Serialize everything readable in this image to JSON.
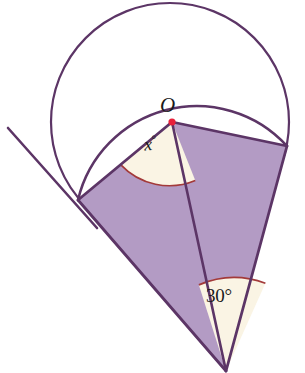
{
  "figure": {
    "canvas": {
      "width": 305,
      "height": 373
    },
    "colors": {
      "stroke": "#5c3566",
      "fill_purple": "#b39bc4",
      "fill_cream": "#faf4e4",
      "arc_marker": "#a33a3a",
      "center_dot": "#e8203a",
      "background": "#ffffff",
      "text": "#1a1a1a"
    },
    "labels": {
      "center_point": "O",
      "angle_at_center_value": "x",
      "angle_at_center_degree_symbol": "°",
      "angle_at_apex": "30°"
    },
    "points": {
      "O": {
        "x": 172,
        "y": 122,
        "name": "circle-center"
      },
      "A": {
        "x": 78,
        "y": 200,
        "name": "left-radius-endpoint"
      },
      "B": {
        "x": 287,
        "y": 146,
        "name": "right-radius-endpoint"
      },
      "P": {
        "x": 226,
        "y": 371,
        "name": "bottom-apex"
      },
      "tangent_line_start": {
        "x": 8,
        "y": 128
      },
      "tangent_line_end": {
        "x": 96,
        "y": 226
      }
    },
    "circle": {
      "cx": 170,
      "cy": 122,
      "r": 119
    },
    "sector": {
      "radius": 122,
      "arc_from": "A",
      "arc_to": "B"
    },
    "angles": {
      "at_center_label": "x°",
      "at_apex_label": "30°",
      "at_apex_value": 30
    }
  }
}
